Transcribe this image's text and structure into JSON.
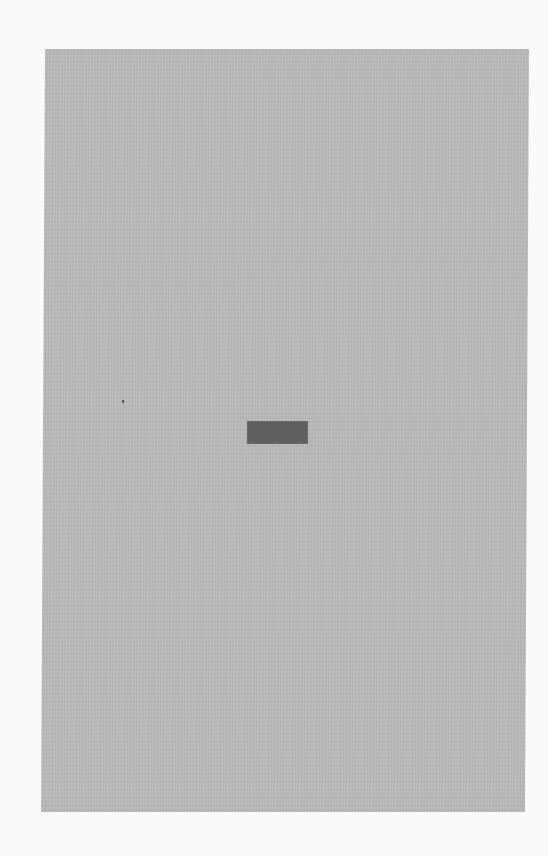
{
  "document": {
    "type": "scanned-page",
    "colors": {
      "background": "#fafafa",
      "page": "#b9b9b9",
      "label_block": "#5f5f5f"
    },
    "elements": {
      "label_block": "",
      "speck": ""
    }
  }
}
